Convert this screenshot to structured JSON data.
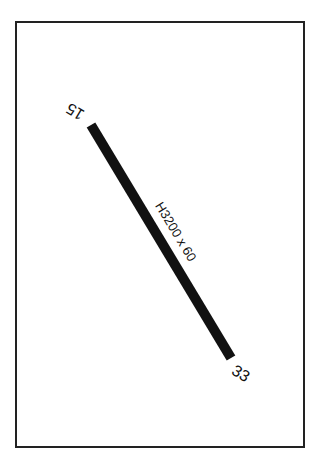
{
  "diagram": {
    "type": "airport-runway-diagram",
    "runway": {
      "designation_start": "15",
      "designation_end": "33",
      "dimensions_label": "H3200 x 60",
      "color": "#111111"
    },
    "frame_color": "#222222",
    "background_color": "#ffffff"
  }
}
